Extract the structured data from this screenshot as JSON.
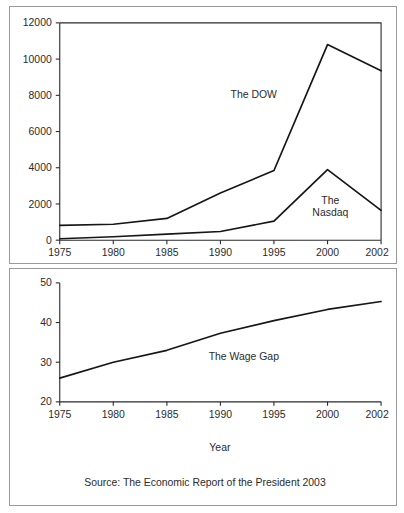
{
  "figure": {
    "background_color": "#ffffff",
    "panel_border_color": "#9a9a9a",
    "line_color": "#161616",
    "text_color": "#2b2b2b"
  },
  "chart_data": [
    {
      "type": "line",
      "title": "",
      "xlabel": "",
      "ylabel": "",
      "categories": [
        "1975",
        "1980",
        "1985",
        "1990",
        "1995",
        "2000",
        "2002"
      ],
      "x": [
        1975,
        1980,
        1985,
        1990,
        1995,
        2000,
        2002
      ],
      "ylim": [
        0,
        12000
      ],
      "yticks": [
        0,
        2000,
        4000,
        6000,
        8000,
        10000,
        12000
      ],
      "ytick_labels": [
        "0",
        "2000",
        "4000",
        "6000",
        "8000",
        "10000",
        "12000"
      ],
      "xtick_labels": [
        "1975",
        "1980",
        "1985",
        "1990",
        "1995",
        "2000",
        "2002"
      ],
      "grid": false,
      "legend": "inline-annotations",
      "series": [
        {
          "name": "The DOW",
          "label": "The DOW",
          "values": [
            820,
            880,
            1200,
            2600,
            3850,
            10800,
            9350
          ]
        },
        {
          "name": "The Nasdaq",
          "label": "The Nasdaq",
          "label_line1": "The",
          "label_line2": "Nasdaq",
          "values": [
            80,
            190,
            330,
            480,
            1050,
            3900,
            1650
          ]
        }
      ]
    },
    {
      "type": "line",
      "title": "",
      "xlabel": "Year",
      "ylabel": "",
      "categories": [
        "1975",
        "1980",
        "1985",
        "1990",
        "1995",
        "2000",
        "2002"
      ],
      "x": [
        1975,
        1980,
        1985,
        1990,
        1995,
        2000,
        2002
      ],
      "ylim": [
        20,
        50
      ],
      "yticks": [
        20,
        30,
        40,
        50
      ],
      "ytick_labels": [
        "20",
        "30",
        "40",
        "50"
      ],
      "xtick_labels": [
        "1975",
        "1980",
        "1985",
        "1990",
        "1995",
        "2000",
        "2002"
      ],
      "grid": false,
      "legend": "inline-annotations",
      "series": [
        {
          "name": "The Wage Gap",
          "label": "The Wage Gap",
          "values": [
            26.0,
            30.0,
            33.0,
            37.3,
            40.5,
            43.3,
            45.3
          ]
        }
      ],
      "source_note": "Source: The Economic Report of the President 2003"
    }
  ],
  "top_chart": {
    "y_labels": {
      "t0": "0",
      "t1": "2000",
      "t2": "4000",
      "t3": "6000",
      "t4": "8000",
      "t5": "10000",
      "t6": "12000"
    },
    "x_labels": {
      "t0": "1975",
      "t1": "1980",
      "t2": "1985",
      "t3": "1990",
      "t4": "1995",
      "t5": "2000",
      "t6": "2002"
    },
    "annotations": {
      "dow": "The DOW",
      "nasdaq_line1": "The",
      "nasdaq_line2": "Nasdaq"
    }
  },
  "bottom_chart": {
    "y_labels": {
      "t0": "20",
      "t1": "30",
      "t2": "40",
      "t3": "50"
    },
    "x_labels": {
      "t0": "1975",
      "t1": "1980",
      "t2": "1985",
      "t3": "1990",
      "t4": "1995",
      "t5": "2000",
      "t6": "2002"
    },
    "annotations": {
      "wage_gap": "The Wage Gap"
    },
    "axis_title": "Year",
    "source": "Source: The Economic Report of the President 2003"
  }
}
